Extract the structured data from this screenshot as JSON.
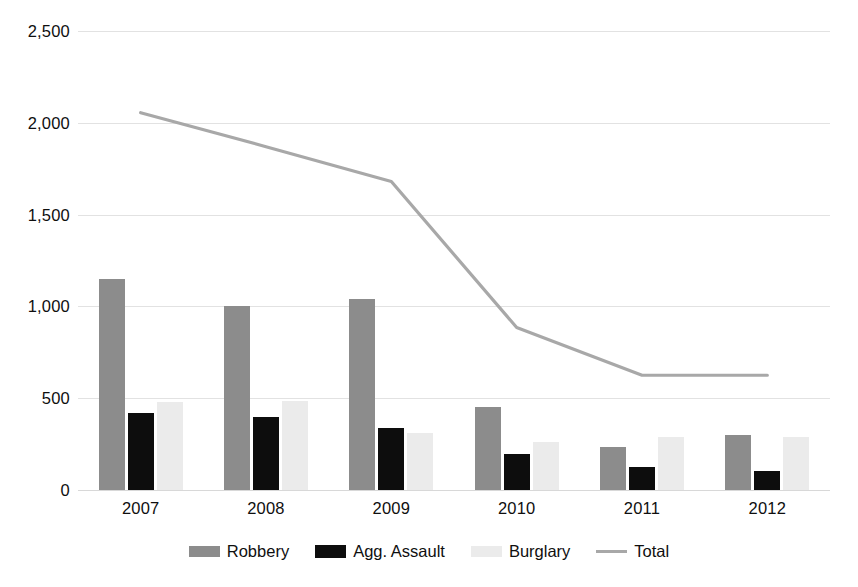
{
  "chart_data": {
    "type": "bar",
    "title": "",
    "subtitle": "",
    "xlabel": "",
    "ylabel": "",
    "categories": [
      "2007",
      "2008",
      "2009",
      "2010",
      "2011",
      "2012"
    ],
    "ylim": [
      0,
      2500
    ],
    "y_ticks": [
      0,
      500,
      1000,
      1500,
      2000,
      2500
    ],
    "y_tick_labels": [
      "0",
      "500",
      "1,000",
      "1,500",
      "2,000",
      "2,500"
    ],
    "grid": true,
    "legend_position": "bottom",
    "series": [
      {
        "name": "Robbery",
        "type": "bar",
        "color": "#8c8c8c",
        "values": [
          1150,
          1000,
          1040,
          450,
          233,
          300
        ]
      },
      {
        "name": "Agg. Assault",
        "type": "bar",
        "color": "#0d0d0d",
        "values": [
          420,
          397,
          340,
          195,
          125,
          105
        ]
      },
      {
        "name": "Burglary",
        "type": "bar",
        "color": "#ebebeb",
        "values": [
          480,
          485,
          310,
          260,
          288,
          288
        ]
      },
      {
        "name": "Total",
        "type": "line",
        "color": "#a8a8a8",
        "values": [
          2055,
          1870,
          1680,
          885,
          625,
          625
        ]
      }
    ]
  },
  "legend": {
    "items": [
      {
        "label": "Robbery",
        "swatch": "robbery"
      },
      {
        "label": "Agg. Assault",
        "swatch": "assault"
      },
      {
        "label": "Burglary",
        "swatch": "burglary"
      },
      {
        "label": "Total",
        "swatch": "total"
      }
    ]
  }
}
